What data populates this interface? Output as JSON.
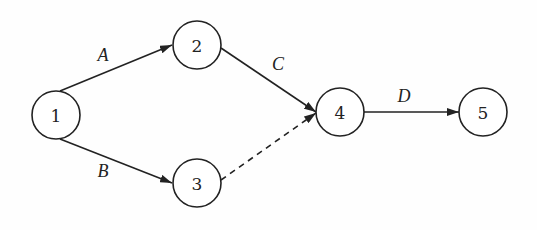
{
  "diagram": {
    "type": "activity-on-arrow network",
    "colors": {
      "stroke": "#222222",
      "background": "#ffffff"
    },
    "nodes": [
      {
        "id": "1",
        "label": "1",
        "cx": 56,
        "cy": 115
      },
      {
        "id": "2",
        "label": "2",
        "cx": 197,
        "cy": 45
      },
      {
        "id": "3",
        "label": "3",
        "cx": 197,
        "cy": 183
      },
      {
        "id": "4",
        "label": "4",
        "cx": 340,
        "cy": 112
      },
      {
        "id": "5",
        "label": "5",
        "cx": 483,
        "cy": 112
      }
    ],
    "edges": [
      {
        "from": "1",
        "to": "2",
        "label": "A",
        "style": "solid"
      },
      {
        "from": "1",
        "to": "3",
        "label": "B",
        "style": "solid"
      },
      {
        "from": "2",
        "to": "4",
        "label": "C",
        "style": "solid"
      },
      {
        "from": "3",
        "to": "4",
        "label": "",
        "style": "dashed"
      },
      {
        "from": "4",
        "to": "5",
        "label": "D",
        "style": "solid"
      }
    ]
  }
}
